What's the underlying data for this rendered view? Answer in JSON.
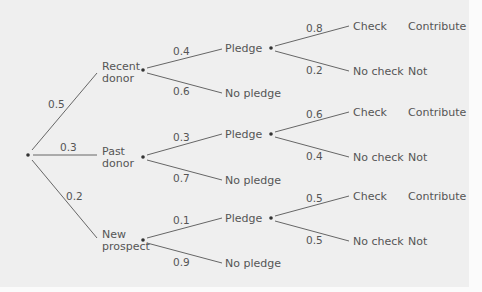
{
  "diagram": {
    "type": "probability_tree",
    "root": {
      "branches": [
        {
          "label_line1": "Recent",
          "label_line2": "donor",
          "prob": "0.5",
          "branches": [
            {
              "label": "Pledge",
              "prob": "0.4",
              "branches": [
                {
                  "label": "Check",
                  "prob": "0.8",
                  "outcome": "Contribute"
                },
                {
                  "label": "No check",
                  "prob": "0.2",
                  "outcome": "Not"
                }
              ]
            },
            {
              "label": "No pledge",
              "prob": "0.6"
            }
          ]
        },
        {
          "label_line1": "Past",
          "label_line2": "donor",
          "prob": "0.3",
          "branches": [
            {
              "label": "Pledge",
              "prob": "0.3",
              "branches": [
                {
                  "label": "Check",
                  "prob": "0.6",
                  "outcome": "Contribute"
                },
                {
                  "label": "No check",
                  "prob": "0.4",
                  "outcome": "Not"
                }
              ]
            },
            {
              "label": "No pledge",
              "prob": "0.7"
            }
          ]
        },
        {
          "label_line1": "New",
          "label_line2": "prospect",
          "prob": "0.2",
          "branches": [
            {
              "label": "Pledge",
              "prob": "0.1",
              "branches": [
                {
                  "label": "Check",
                  "prob": "0.5",
                  "outcome": "Contribute"
                },
                {
                  "label": "No check",
                  "prob": "0.5",
                  "outcome": "Not"
                }
              ]
            },
            {
              "label": "No pledge",
              "prob": "0.9"
            }
          ]
        }
      ]
    }
  },
  "colors": {
    "background": "#efefef",
    "line": "#666666",
    "text": "#555555"
  }
}
